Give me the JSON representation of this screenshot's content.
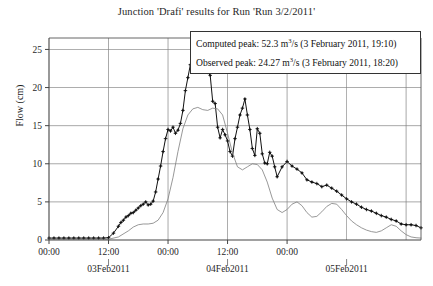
{
  "chart_data": {
    "type": "line",
    "title": "Junction 'Drafi' results for Run 'Run 3/2/2011'",
    "xlabel": "",
    "ylabel": "Flow (cm)",
    "ylim": [
      0,
      26.5
    ],
    "yticks": [
      0,
      5,
      10,
      15,
      20,
      25
    ],
    "ytick_labels": [
      "0",
      "5",
      "10",
      "15",
      "20",
      "25"
    ],
    "xlim_hours": [
      0,
      75
    ],
    "xticks_hours": [
      0,
      12,
      24,
      36,
      48,
      60,
      72
    ],
    "xtick_labels": [
      "00:00",
      "12:00",
      "00:00",
      "12:00",
      "00:00",
      "",
      ""
    ],
    "xtick_labels_shown": [
      "00:00",
      "12:00",
      "00:00",
      "12:00",
      "00:00"
    ],
    "xtick_label_hours": [
      0,
      12,
      24,
      36,
      48
    ],
    "date_labels": [
      {
        "text": "03Feb2011",
        "hour": 12
      },
      {
        "text": "04Feb2011",
        "hour": 36
      },
      {
        "text": "05Feb2011",
        "hour": 60
      }
    ],
    "grid": true,
    "grid_color": "#808080",
    "axis_color": "#555555",
    "legend_position": "top-right",
    "series": [
      {
        "name": "Observed",
        "style": "line-with-markers",
        "color": "#111111",
        "marker": "plus-dot",
        "x_hours": [
          0,
          1,
          2,
          3,
          4,
          5,
          6,
          7,
          8,
          9,
          10,
          11,
          12,
          13,
          14,
          14.5,
          15,
          15.5,
          16,
          16.5,
          17,
          17.5,
          18,
          18.5,
          19,
          19.5,
          20,
          20.5,
          21,
          21.5,
          22,
          22.5,
          23,
          23.5,
          24,
          24.5,
          25,
          25.5,
          26,
          26.5,
          27,
          27.5,
          28,
          28.5,
          29,
          29.5,
          30,
          30.5,
          31,
          31.5,
          32,
          32.5,
          33,
          33.5,
          34,
          34.5,
          35,
          35.5,
          36,
          36.5,
          37,
          37.5,
          38,
          38.5,
          39,
          39.5,
          40,
          40.5,
          41,
          41.5,
          42,
          42.5,
          43,
          43.5,
          44,
          44.5,
          45,
          45.5,
          46,
          47,
          48,
          49,
          50,
          51,
          52,
          53,
          54,
          55,
          56,
          57,
          58,
          59,
          60,
          61,
          62,
          63,
          64,
          65,
          66,
          67,
          68,
          69,
          70,
          71,
          72,
          73,
          74,
          75
        ],
        "y_values": [
          0.25,
          0.25,
          0.25,
          0.25,
          0.25,
          0.25,
          0.25,
          0.25,
          0.25,
          0.25,
          0.25,
          0.25,
          0.3,
          0.9,
          1.8,
          2.3,
          2.6,
          3.0,
          3.2,
          3.5,
          3.6,
          3.9,
          4.2,
          4.5,
          4.7,
          5.0,
          4.6,
          4.7,
          5.1,
          6.3,
          8.0,
          9.7,
          11.6,
          13.3,
          14.5,
          14.3,
          14.8,
          14.0,
          14.4,
          15.3,
          17.0,
          19.6,
          21.3,
          23.0,
          23.5,
          24.1,
          24.27,
          23.7,
          23.3,
          23.6,
          22.0,
          21.6,
          18.2,
          17.9,
          14.8,
          13.4,
          14.5,
          13.8,
          13.0,
          11.6,
          11.0,
          13.3,
          14.8,
          16.4,
          17.3,
          18.5,
          16.4,
          14.5,
          12.0,
          11.1,
          14.6,
          14.0,
          11.3,
          10.1,
          10.0,
          11.5,
          11.0,
          9.6,
          8.3,
          9.6,
          10.3,
          9.7,
          9.3,
          8.8,
          7.9,
          7.6,
          7.4,
          7.0,
          7.2,
          6.8,
          6.4,
          5.9,
          5.4,
          5.0,
          4.7,
          4.3,
          4.0,
          3.8,
          3.5,
          3.2,
          3.0,
          2.7,
          2.5,
          2.1,
          2.0,
          2.0,
          1.9,
          1.6,
          1.5,
          1.5,
          1.4
        ]
      },
      {
        "name": "Computed",
        "style": "thin-line",
        "color": "#7d7d7d",
        "marker": "none",
        "x_hours": [
          0,
          4,
          8,
          12,
          14,
          16,
          17,
          18,
          19,
          20,
          21,
          22,
          23,
          24,
          25,
          26,
          27,
          28,
          29,
          30,
          31,
          32,
          33,
          34,
          35,
          36,
          37,
          38,
          39,
          40,
          41,
          42,
          43,
          44,
          45,
          46,
          47,
          48,
          49,
          50,
          51,
          52,
          53,
          54,
          55,
          56,
          57,
          58,
          59,
          60,
          61,
          62,
          63,
          64,
          65,
          66,
          67,
          68,
          69,
          70,
          71,
          72,
          73,
          74,
          75
        ],
        "y_values": [
          0.1,
          0.1,
          0.1,
          0.1,
          0.4,
          1.2,
          1.7,
          2.0,
          2.1,
          2.1,
          2.2,
          2.6,
          3.6,
          5.4,
          8.2,
          11.6,
          14.6,
          16.4,
          17.2,
          17.4,
          17.1,
          17.0,
          17.3,
          17.2,
          16.4,
          14.0,
          11.4,
          9.6,
          9.2,
          9.6,
          10.0,
          9.9,
          9.2,
          7.6,
          5.5,
          4.0,
          3.6,
          4.0,
          4.7,
          5.0,
          4.5,
          3.6,
          3.0,
          3.1,
          3.7,
          4.4,
          4.8,
          4.7,
          4.0,
          3.2,
          2.5,
          2.0,
          1.6,
          1.3,
          1.1,
          1.0,
          1.2,
          1.6,
          2.0,
          1.8,
          1.2,
          0.7,
          0.4,
          0.3,
          0.25
        ]
      }
    ],
    "annotations": {
      "computed_peak_value": 52.3,
      "computed_peak_units": "m3/s",
      "computed_peak_time": "3 February 2011, 19:10",
      "observed_peak_value": 24.27,
      "observed_peak_units": "m3/s",
      "observed_peak_time": "3 February 2011, 18:20"
    }
  },
  "legend": {
    "computed_prefix": "Computed peak: 52.3 m",
    "computed_exp": "3",
    "computed_suffix": "/s (3 February 2011, 19:10)",
    "observed_prefix": "Observed peak: 24.27 m",
    "observed_exp": "3",
    "observed_suffix": "/s (3 February 2011, 18:20)"
  }
}
